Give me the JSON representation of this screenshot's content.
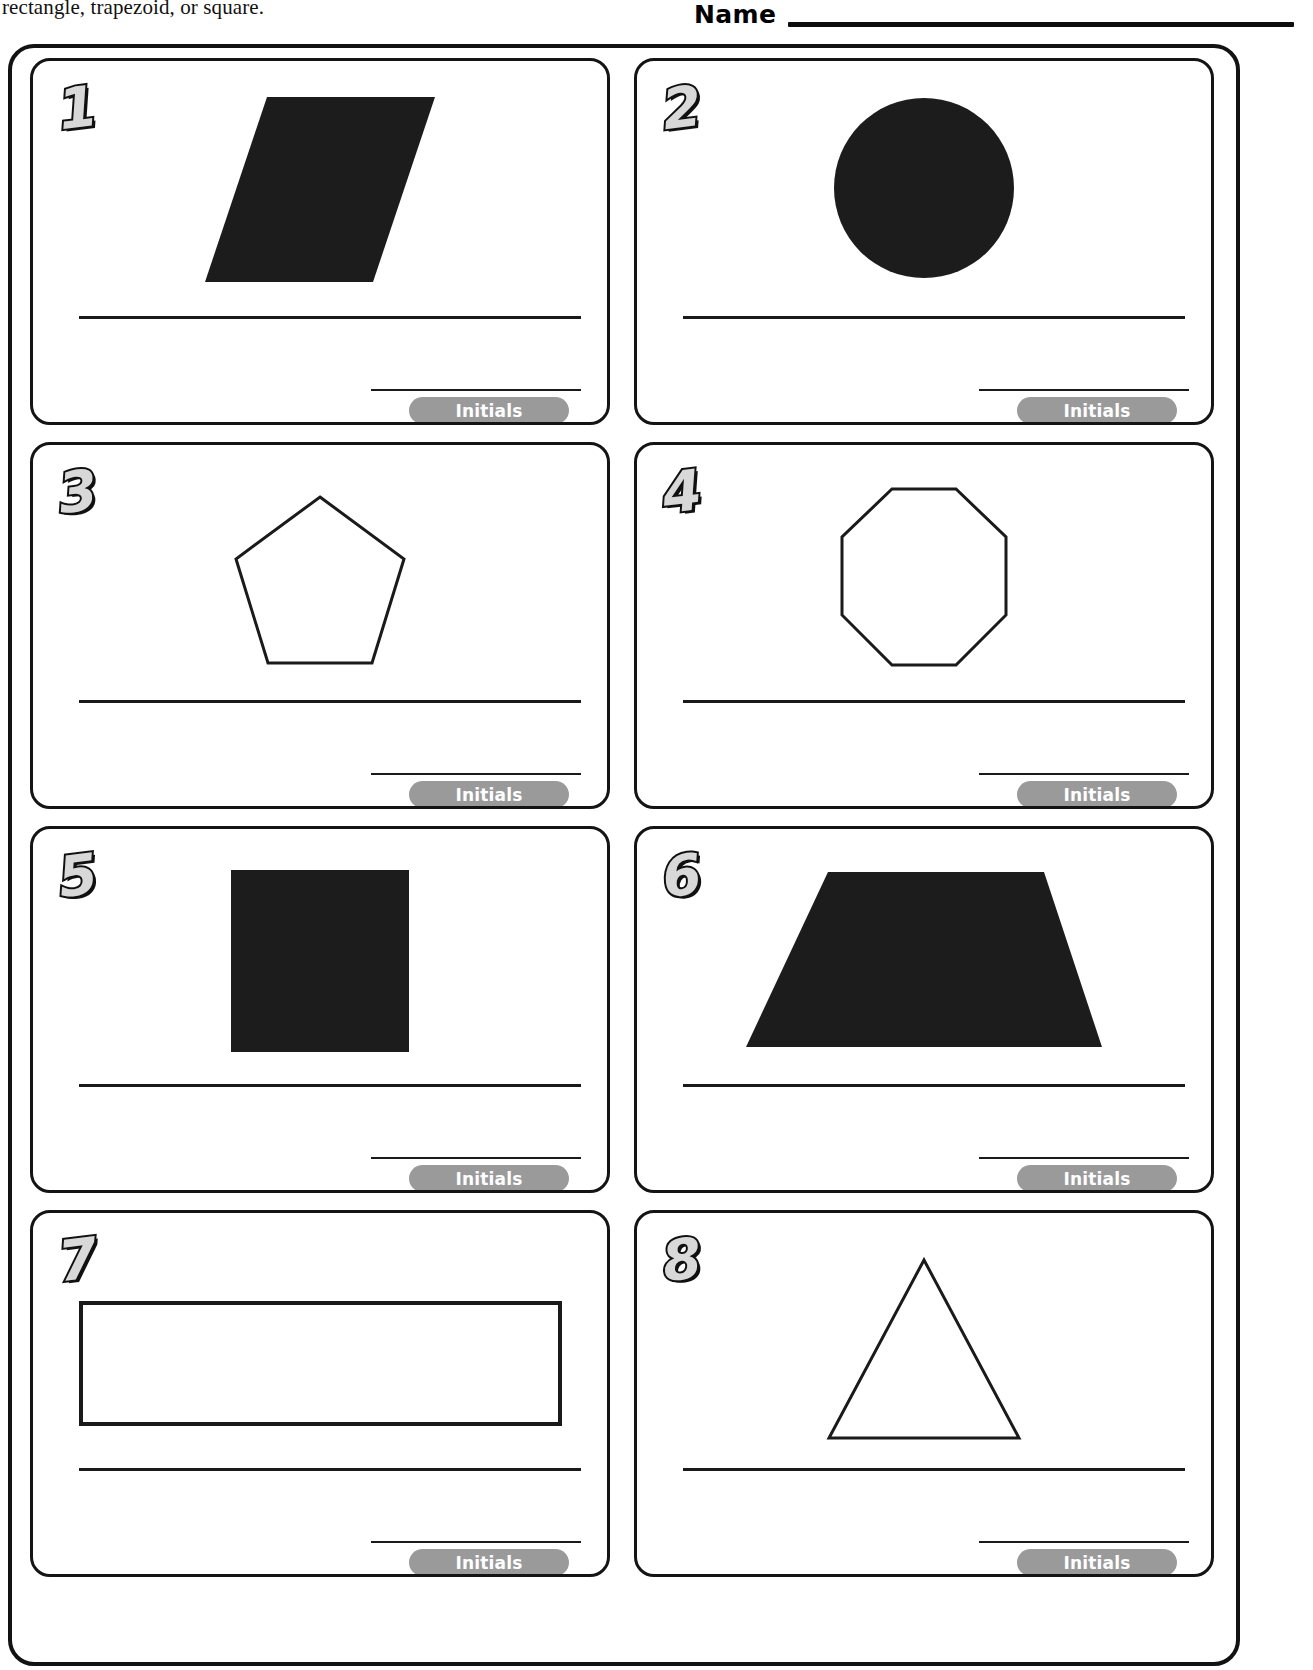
{
  "header": {
    "instructions_line_clipped": "parallelogram, circle, pentagon, octagon, triangle,",
    "instructions_line2": "rectangle, trapezoid, or square.",
    "name_label": "Name"
  },
  "colors": {
    "ink": "#141414",
    "shape_fill_solid": "#1c1c1c",
    "initials_pill": "#9a9a9a",
    "initials_text": "#ffffff",
    "numeral_fill": "#d8d8d8",
    "numeral_outline": "#101010",
    "page_background": "#ffffff"
  },
  "common": {
    "initials_label": "Initials"
  },
  "cards": [
    {
      "number": "1",
      "shape_name": "parallelogram",
      "shape_style": "filled",
      "answer_value": "",
      "initials_value": ""
    },
    {
      "number": "2",
      "shape_name": "circle",
      "shape_style": "filled",
      "answer_value": "",
      "initials_value": ""
    },
    {
      "number": "3",
      "shape_name": "pentagon",
      "shape_style": "outline",
      "answer_value": "",
      "initials_value": ""
    },
    {
      "number": "4",
      "shape_name": "octagon",
      "shape_style": "outline",
      "answer_value": "",
      "initials_value": ""
    },
    {
      "number": "5",
      "shape_name": "square",
      "shape_style": "filled",
      "answer_value": "",
      "initials_value": ""
    },
    {
      "number": "6",
      "shape_name": "trapezoid",
      "shape_style": "filled",
      "answer_value": "",
      "initials_value": ""
    },
    {
      "number": "7",
      "shape_name": "rectangle",
      "shape_style": "outline",
      "answer_value": "",
      "initials_value": ""
    },
    {
      "number": "8",
      "shape_name": "triangle",
      "shape_style": "outline",
      "answer_value": "",
      "initials_value": ""
    }
  ]
}
